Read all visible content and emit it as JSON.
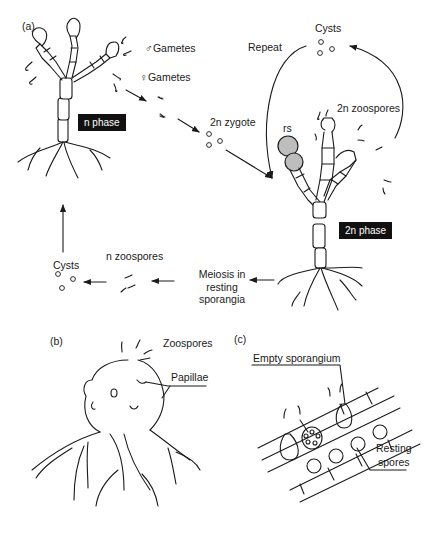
{
  "panels": {
    "a": {
      "label": "(a)",
      "n_phase": "n phase",
      "two_n_phase": "2n phase",
      "male_gametes": "♂Gametes",
      "female_gametes": "♀Gametes",
      "zygote": "2n zygote",
      "cysts_top": "Cysts",
      "repeat": "Repeat",
      "zoospores_2n": "2n zoospores",
      "rs": "rs",
      "meiosis_line1": "Meiosis in",
      "meiosis_line2": "resting",
      "meiosis_line3": "sporangia",
      "n_zoospores": "n zoospores",
      "cysts_bottom": "Cysts"
    },
    "b": {
      "label": "(b)",
      "zoospores": "Zoospores",
      "papillae": "Papillae"
    },
    "c": {
      "label": "(c)",
      "empty_sporangium": "Empty sporangium",
      "resting_line1": "Resting",
      "resting_line2": "spores"
    }
  },
  "colors": {
    "line": "#1a1a1a",
    "phase_bg": "#111111",
    "resting_sporangia_fill": "#bdbdbd"
  }
}
